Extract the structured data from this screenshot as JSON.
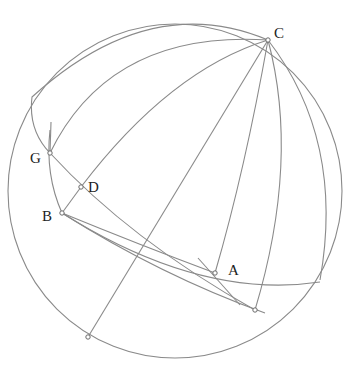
{
  "diagram": {
    "type": "spherical geometry construction",
    "sphere": {
      "cx": 175,
      "cy": 191,
      "r": 167
    },
    "colors": {
      "line": "#8a8a8a",
      "point_stroke": "#6a6a6a",
      "label": "#222222",
      "background": "#ffffff"
    },
    "points": [
      {
        "id": "C",
        "label": "C",
        "x": 268,
        "y": 40,
        "lx": 274,
        "ly": 38
      },
      {
        "id": "G",
        "label": "G",
        "x": 50,
        "y": 153,
        "lx": 30,
        "ly": 163
      },
      {
        "id": "D",
        "label": "D",
        "x": 81,
        "y": 187,
        "lx": 88,
        "ly": 192
      },
      {
        "id": "B",
        "label": "B",
        "x": 62,
        "y": 213,
        "lx": 42,
        "ly": 221
      },
      {
        "id": "A",
        "label": "A",
        "x": 215,
        "y": 273,
        "lx": 228,
        "ly": 275
      },
      {
        "id": "P1",
        "label": "",
        "x": 255,
        "y": 310
      },
      {
        "id": "P2",
        "label": "",
        "x": 88,
        "y": 337
      }
    ],
    "curves": [
      {
        "name": "great-circle-CG",
        "d": "M 268 40 Q 110 30 50 153"
      },
      {
        "name": "great-circle-C-top-left",
        "d": "M 268 40 Q 150 -10 32 97 Q 28 130 50 153"
      },
      {
        "name": "great-circle-CD",
        "d": "M 268 40 Q 170 70 81 187"
      },
      {
        "name": "diameter-C-P2",
        "d": "M 268 40 L 88 337"
      },
      {
        "name": "line-DB",
        "d": "M 81 187 L 62 213"
      },
      {
        "name": "great-circle-C-A",
        "d": "M 268 40 Q 245 170 215 273"
      },
      {
        "name": "great-circle-C-P1",
        "d": "M 268 40 Q 300 160 255 310"
      },
      {
        "name": "great-circle-C-right",
        "d": "M 268 40 Q 345 140 320 280"
      },
      {
        "name": "arc-G-B",
        "d": "M 50 130 Q 45 175 62 213"
      },
      {
        "name": "arc-GD-A-P1",
        "d": "M 50 153 Q 130 240 255 310"
      },
      {
        "name": "arc-B-A",
        "d": "M 62 213 Q 140 245 215 273"
      },
      {
        "name": "arc-B-P1",
        "d": "M 62 213 Q 160 275 265 313"
      },
      {
        "name": "arc-B-A-right",
        "d": "M 62 213 Q 200 300 320 282"
      },
      {
        "name": "tick-A",
        "d": "M 198 258 L 240 305"
      },
      {
        "name": "tick-G",
        "d": "M 51 122 L 50 153"
      }
    ]
  }
}
